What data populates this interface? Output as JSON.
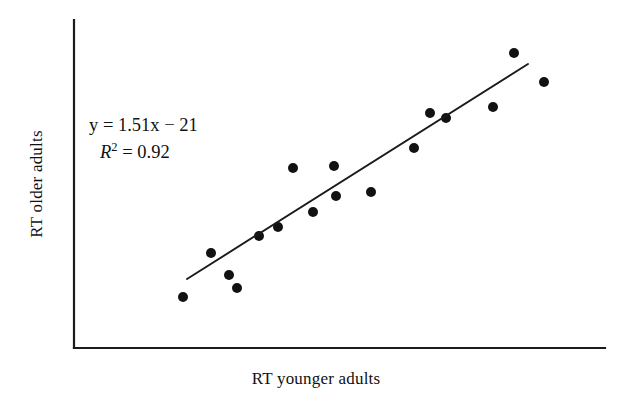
{
  "chart_data": {
    "type": "scatter",
    "title": "",
    "xlabel": "RT younger adults",
    "ylabel": "RT older adults",
    "grid": false,
    "legend": null,
    "xlim": [
      0,
      100
    ],
    "ylim": [
      0,
      100
    ],
    "axis_ticks": {
      "x": [],
      "y": []
    },
    "points": [
      {
        "px": 183,
        "py": 297
      },
      {
        "px": 211,
        "py": 253
      },
      {
        "px": 229,
        "py": 275
      },
      {
        "px": 237,
        "py": 288
      },
      {
        "px": 259,
        "py": 236
      },
      {
        "px": 278,
        "py": 227
      },
      {
        "px": 293,
        "py": 168
      },
      {
        "px": 313,
        "py": 212
      },
      {
        "px": 334,
        "py": 166
      },
      {
        "px": 336,
        "py": 196
      },
      {
        "px": 371,
        "py": 192
      },
      {
        "px": 414,
        "py": 148
      },
      {
        "px": 430,
        "py": 113
      },
      {
        "px": 446,
        "py": 118
      },
      {
        "px": 493,
        "py": 107
      },
      {
        "px": 514,
        "py": 53
      },
      {
        "px": 544,
        "py": 82
      }
    ],
    "trendline": {
      "x1": 187,
      "y1": 279,
      "x2": 528,
      "y2": 64,
      "slope": 1.51,
      "intercept": -21,
      "r_squared": 0.92
    },
    "annotations": {
      "equation_y": "y",
      "equation_eq": " = ",
      "equation_body": "1.51x − 21",
      "r2_symbol": "R",
      "r2_exponent": "2",
      "r2_eq": " = ",
      "r2_value": "0.92"
    }
  },
  "axes": {
    "y_axis": {
      "x": 74,
      "y_top": 20,
      "y_bottom": 348
    },
    "x_axis": {
      "y": 348,
      "x_left": 74,
      "x_right": 605
    }
  },
  "style": {
    "point_color": "#121212",
    "line_color": "#1b1b1b",
    "axis_color": "#1b1b1b",
    "background": "#ffffff",
    "point_radius": 5
  }
}
